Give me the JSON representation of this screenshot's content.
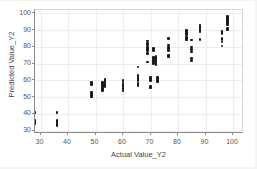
{
  "chart_data": {
    "type": "scatter",
    "title": "",
    "xlabel": "Actual Value_Y2",
    "ylabel": "Predicted Value_Y2",
    "xlim": [
      28,
      104
    ],
    "ylim": [
      28,
      102
    ],
    "xticks": [
      30,
      40,
      50,
      60,
      70,
      80,
      90,
      100
    ],
    "yticks": [
      30,
      40,
      50,
      60,
      70,
      80,
      90,
      100
    ],
    "grid": true,
    "legend": "none",
    "marker_color": "#151515",
    "marker_size": 2.6,
    "series": [
      {
        "name": "Predicted vs Actual",
        "points": [
          [
            28,
            34.0
          ],
          [
            28,
            34.6
          ],
          [
            28,
            35.2
          ],
          [
            28,
            36.0
          ],
          [
            28,
            40.6
          ],
          [
            28,
            41.2
          ],
          [
            36,
            33.0
          ],
          [
            36,
            33.8
          ],
          [
            36,
            34.5
          ],
          [
            36,
            35.2
          ],
          [
            36,
            36.0
          ],
          [
            36,
            41.0
          ],
          [
            48.5,
            50.0
          ],
          [
            48.5,
            51.0
          ],
          [
            48.5,
            52.0
          ],
          [
            48.5,
            53.0
          ],
          [
            48.5,
            57.5
          ],
          [
            48.5,
            58.6
          ],
          [
            52.5,
            54.0
          ],
          [
            52.5,
            55.0
          ],
          [
            52.5,
            56.0
          ],
          [
            52.5,
            57.0
          ],
          [
            52.5,
            58.0
          ],
          [
            52.5,
            59.0
          ],
          [
            53.5,
            56.0
          ],
          [
            53.5,
            57.0
          ],
          [
            53.5,
            58.0
          ],
          [
            53.5,
            59.0
          ],
          [
            53.5,
            60.0
          ],
          [
            53.5,
            60.8
          ],
          [
            60,
            54.0
          ],
          [
            60,
            55.0
          ],
          [
            60,
            56.0
          ],
          [
            60,
            57.0
          ],
          [
            60,
            58.0
          ],
          [
            60,
            60.0
          ],
          [
            65.5,
            57.0
          ],
          [
            65.5,
            58.2
          ],
          [
            65.5,
            60.0
          ],
          [
            65.5,
            61.0
          ],
          [
            65.5,
            62.0
          ],
          [
            65.5,
            63.0
          ],
          [
            65.5,
            68.0
          ],
          [
            69,
            71.0
          ],
          [
            69,
            76.0
          ],
          [
            69,
            78.0
          ],
          [
            69,
            79.0
          ],
          [
            69,
            80.0
          ],
          [
            69,
            81.0
          ],
          [
            69,
            82.0
          ],
          [
            69,
            83.5
          ],
          [
            70,
            55.5
          ],
          [
            70,
            56.5
          ],
          [
            70,
            60.0
          ],
          [
            70,
            61.0
          ],
          [
            70,
            62.0
          ],
          [
            71,
            70.0
          ],
          [
            71,
            71.0
          ],
          [
            71,
            72.0
          ],
          [
            71,
            73.0
          ],
          [
            71,
            74.0
          ],
          [
            71,
            78.0
          ],
          [
            71,
            79.0
          ],
          [
            72,
            69.5
          ],
          [
            72,
            70.5
          ],
          [
            72,
            71.5
          ],
          [
            72,
            72.5
          ],
          [
            72,
            73.5
          ],
          [
            72,
            74.5
          ],
          [
            72.5,
            59.0
          ],
          [
            72.5,
            60.0
          ],
          [
            72.5,
            61.0
          ],
          [
            72.5,
            62.0
          ],
          [
            76.5,
            74.0
          ],
          [
            76.5,
            75.0
          ],
          [
            76.5,
            78.0
          ],
          [
            76.5,
            79.0
          ],
          [
            76.5,
            80.0
          ],
          [
            76.5,
            81.0
          ],
          [
            76.5,
            85.0
          ],
          [
            83,
            84.0
          ],
          [
            83,
            85.0
          ],
          [
            83,
            86.0
          ],
          [
            83,
            87.0
          ],
          [
            83,
            88.0
          ],
          [
            83,
            89.0
          ],
          [
            83,
            90.0
          ],
          [
            85,
            71.5
          ],
          [
            85,
            73.0
          ],
          [
            85,
            77.0
          ],
          [
            85,
            78.5
          ],
          [
            85,
            80.0
          ],
          [
            85,
            84.0
          ],
          [
            88,
            84.5
          ],
          [
            88,
            89.0
          ],
          [
            88,
            90.0
          ],
          [
            88,
            91.0
          ],
          [
            88,
            92.0
          ],
          [
            88,
            93.0
          ],
          [
            96,
            80.5
          ],
          [
            96,
            83.0
          ],
          [
            96,
            84.0
          ],
          [
            96,
            85.0
          ],
          [
            96,
            88.0
          ],
          [
            96,
            89.0
          ],
          [
            98,
            90.0
          ],
          [
            98,
            91.0
          ],
          [
            98,
            93.0
          ],
          [
            98,
            94.0
          ],
          [
            98,
            95.0
          ],
          [
            98,
            96.0
          ],
          [
            98,
            97.0
          ],
          [
            98,
            98.0
          ],
          [
            104,
            86.0
          ],
          [
            104,
            87.5
          ],
          [
            104,
            90.0
          ],
          [
            104,
            94.0
          ],
          [
            104,
            95.0
          ],
          [
            104,
            96.0
          ],
          [
            104,
            97.0
          ],
          [
            104,
            98.0
          ]
        ]
      }
    ]
  }
}
